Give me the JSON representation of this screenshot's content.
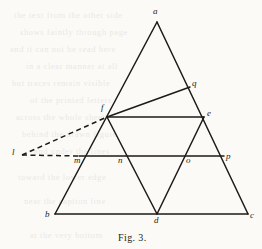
{
  "figure": {
    "caption": "Fig. 3.",
    "stroke_color": "#1d1b18",
    "background_color": "#fbfaf7",
    "width": 262,
    "height": 249,
    "points": {
      "a": {
        "label": "a",
        "x": 157,
        "y": 22,
        "lx": 153,
        "ly": 7
      },
      "b": {
        "label": "b",
        "x": 55,
        "y": 214,
        "lx": 45,
        "ly": 210
      },
      "c": {
        "label": "c",
        "x": 248,
        "y": 214,
        "lx": 250,
        "ly": 211
      },
      "d": {
        "label": "d",
        "x": 157,
        "y": 214,
        "lx": 154,
        "ly": 216
      },
      "e": {
        "label": "e",
        "x": 204,
        "y": 117,
        "lx": 207,
        "ly": 109
      },
      "f": {
        "label": "f",
        "x": 107,
        "y": 117,
        "lx": 101,
        "ly": 103
      },
      "l": {
        "label": "l",
        "x": 22,
        "y": 155,
        "lx": 12,
        "ly": 148
      },
      "m": {
        "label": "m",
        "x": 79,
        "y": 156,
        "lx": 74,
        "ly": 156
      },
      "n": {
        "label": "n",
        "x": 122,
        "y": 156,
        "lx": 118,
        "ly": 156
      },
      "o": {
        "label": "o",
        "x": 190,
        "y": 156,
        "lx": 186,
        "ly": 156
      },
      "p": {
        "label": "p",
        "x": 224,
        "y": 156,
        "lx": 226,
        "ly": 152
      },
      "q": {
        "label": "q",
        "x": 190,
        "y": 87,
        "lx": 192,
        "ly": 79
      }
    },
    "solid_edges": [
      {
        "name": "edge-ab",
        "from": "a",
        "to": "b"
      },
      {
        "name": "edge-ac",
        "from": "a",
        "to": "c"
      },
      {
        "name": "edge-bc",
        "from": "b",
        "to": "c"
      },
      {
        "name": "edge-fe",
        "from": "f",
        "to": "e"
      },
      {
        "name": "edge-fd",
        "from": "f",
        "to": "d"
      },
      {
        "name": "edge-ed",
        "from": "e",
        "to": "d"
      },
      {
        "name": "edge-mp",
        "from": "m",
        "to": "p"
      },
      {
        "name": "edge-fq",
        "from": "f",
        "to": "q"
      }
    ],
    "dashed_edges": [
      {
        "name": "edge-lf-dashed",
        "from": "l",
        "to": "f"
      },
      {
        "name": "edge-lm-dashed",
        "from": "l",
        "to": "m"
      }
    ],
    "bleed_text": [
      {
        "text": "the  text  from  the  other  side",
        "x": 14,
        "y": 10
      },
      {
        "text": "shows  faintly  through  page",
        "x": 20,
        "y": 27
      },
      {
        "text": "and  it  can  not  be  read  here",
        "x": 10,
        "y": 44
      },
      {
        "text": "in  a  clear  manner  at  all",
        "x": 26,
        "y": 61
      },
      {
        "text": "but  traces  remain  visible",
        "x": 12,
        "y": 78
      },
      {
        "text": "of  the  printed  letters",
        "x": 30,
        "y": 95
      },
      {
        "text": "across  the  whole  sheet",
        "x": 16,
        "y": 112
      },
      {
        "text": "behind  the  drawn  figure",
        "x": 22,
        "y": 129
      },
      {
        "text": "and  under  the  lines",
        "x": 34,
        "y": 146
      },
      {
        "text": "toward  the  lower  edge",
        "x": 18,
        "y": 172
      },
      {
        "text": "near  the  caption  line",
        "x": 24,
        "y": 196
      },
      {
        "text": "at  the  very  bottom",
        "x": 30,
        "y": 230
      }
    ]
  }
}
